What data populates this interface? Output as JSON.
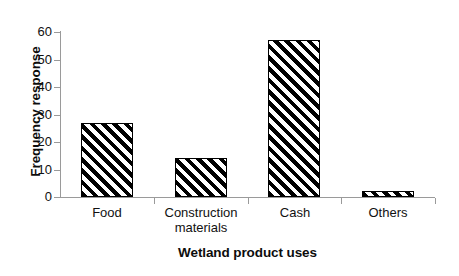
{
  "chart_data": {
    "type": "bar",
    "title": "",
    "subtitle": "",
    "xlabel": "Wetland product uses",
    "ylabel": "Frequency response",
    "categories": [
      "Food",
      "Construction materials",
      "Cash",
      "Others"
    ],
    "category_lines": [
      [
        "Food"
      ],
      [
        "Construction",
        "materials"
      ],
      [
        "Cash"
      ],
      [
        "Others"
      ]
    ],
    "values": [
      27,
      14,
      57,
      2
    ],
    "series": [
      {
        "name": "Frequency response",
        "values": [
          27,
          14,
          57,
          2
        ]
      }
    ],
    "ylim": [
      0,
      60
    ],
    "ytick_step": 10,
    "yticks": [
      60,
      50,
      40,
      30,
      20,
      10,
      0
    ],
    "xlim_categories": 4,
    "grid": false,
    "legend": false,
    "legend_position": "none",
    "bar_fill": "diagonal-hatch",
    "bar_fill_color": "#000000",
    "bar_background_color": "#ffffff",
    "bar_border_color": "#000000",
    "axis_color": "#9a9a9a",
    "text_color": "#111111",
    "annotations": []
  },
  "axis_titles": {
    "y": "Frequency response",
    "x": "Wetland product uses"
  }
}
